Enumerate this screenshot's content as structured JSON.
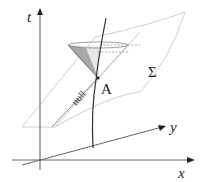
{
  "diagram": {
    "axes": {
      "t": "t",
      "x": "x",
      "y": "y"
    },
    "labels": {
      "point": "A",
      "surface": "Σ",
      "null_line": "null",
      "timelike_curve": "timelike"
    },
    "colors": {
      "axis": "#333333",
      "surface_edge": "#cccccc",
      "cone_shade": "#999999",
      "null_line": "#888888",
      "curve": "#333333"
    }
  }
}
